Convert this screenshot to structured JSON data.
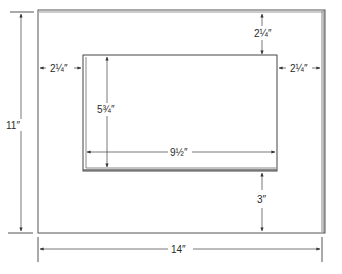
{
  "diagram": {
    "line_color": "#555555",
    "outer": {
      "width_label": "14″",
      "height_label": "11″"
    },
    "window": {
      "width_label": "9½″",
      "height_label": "5¾″"
    },
    "margins": {
      "top": "2¼″",
      "left": "2¼″",
      "right": "2¼″",
      "bottom": "3″"
    }
  }
}
